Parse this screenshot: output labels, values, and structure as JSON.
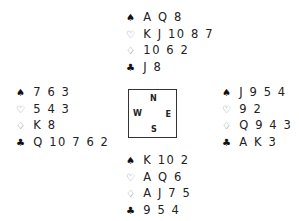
{
  "suits": {
    "spades": "♠",
    "hearts": "♡",
    "diamonds": "♢",
    "clubs": "♣"
  },
  "compass": {
    "north": "N",
    "west": "W",
    "east": "E",
    "south": "S"
  },
  "hands": {
    "north": {
      "spades": "A Q 8",
      "hearts": "K J 10 8 7",
      "diamonds": "10 6 2",
      "clubs": "J 8"
    },
    "west": {
      "spades": "7 6 3",
      "hearts": "5 4 3",
      "diamonds": "K 8",
      "clubs": "Q 10 7 6 2"
    },
    "east": {
      "spades": "J 9 5 4",
      "hearts": "9 2",
      "diamonds": "Q 9 4 3",
      "clubs": "A K 3"
    },
    "south": {
      "spades": "K 10 2",
      "hearts": "A Q 6",
      "diamonds": "A J 7 5",
      "clubs": "9 5 4"
    }
  }
}
